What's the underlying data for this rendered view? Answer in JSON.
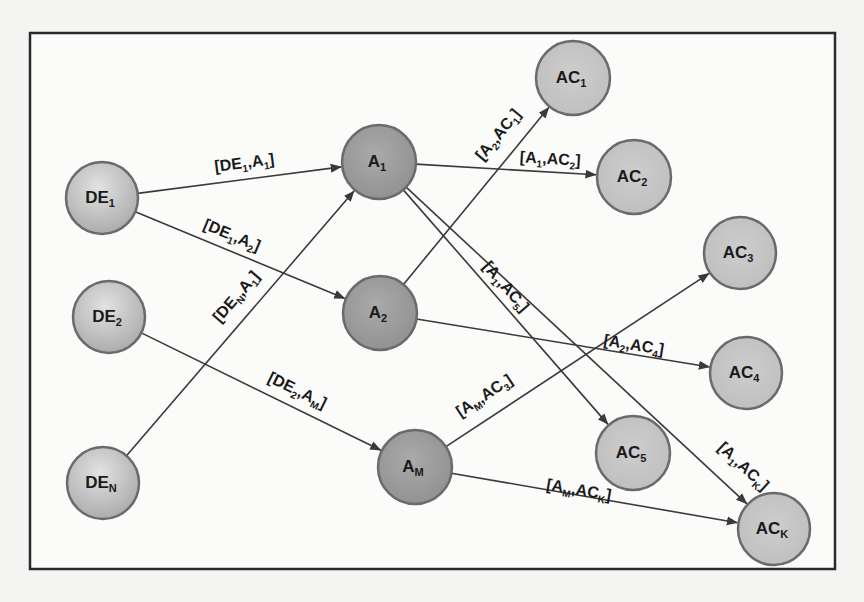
{
  "diagram": {
    "frame": {
      "x": 30,
      "y": 33,
      "w": 805,
      "h": 536,
      "stroke": "#2a2a2a"
    },
    "colors": {
      "source_fill": "#bdbdbd",
      "mid_fill": "#9a9a9a",
      "target_fill": "#c2c2c2",
      "node_stroke": "#6a6a6a",
      "edge": "#3a3a3a"
    },
    "nodes": [
      {
        "id": "DE1",
        "base": "DE",
        "sub": "1",
        "type": "source",
        "x": 102,
        "y": 198,
        "r": 36
      },
      {
        "id": "DE2",
        "base": "DE",
        "sub": "2",
        "type": "source",
        "x": 109,
        "y": 317,
        "r": 36
      },
      {
        "id": "DEN",
        "base": "DE",
        "sub": "N",
        "type": "source",
        "x": 103,
        "y": 483,
        "r": 36
      },
      {
        "id": "A1",
        "base": "A",
        "sub": "1",
        "type": "mid",
        "x": 379,
        "y": 162,
        "r": 37
      },
      {
        "id": "A2",
        "base": "A",
        "sub": "2",
        "type": "mid",
        "x": 380,
        "y": 313,
        "r": 37
      },
      {
        "id": "AM",
        "base": "A",
        "sub": "M",
        "type": "mid",
        "x": 415,
        "y": 467,
        "r": 37
      },
      {
        "id": "AC1",
        "base": "AC",
        "sub": "1",
        "type": "target",
        "x": 573,
        "y": 78,
        "r": 37
      },
      {
        "id": "AC2",
        "base": "AC",
        "sub": "2",
        "type": "target",
        "x": 634,
        "y": 177,
        "r": 37
      },
      {
        "id": "AC3",
        "base": "AC",
        "sub": "3",
        "type": "target",
        "x": 740,
        "y": 253,
        "r": 36
      },
      {
        "id": "AC4",
        "base": "AC",
        "sub": "4",
        "type": "target",
        "x": 746,
        "y": 373,
        "r": 36
      },
      {
        "id": "AC5",
        "base": "AC",
        "sub": "5",
        "type": "target",
        "x": 633,
        "y": 453,
        "r": 37
      },
      {
        "id": "ACK",
        "base": "AC",
        "sub": "K",
        "type": "target",
        "x": 774,
        "y": 529,
        "r": 36
      }
    ],
    "edges": [
      {
        "from": "DE1",
        "to": "A1",
        "label": [
          "DE",
          "1",
          "A",
          "1"
        ],
        "lx": 245,
        "ly": 168,
        "t": 0.5,
        "side": -1
      },
      {
        "from": "DE1",
        "to": "A2",
        "label": [
          "DE",
          "1",
          "A",
          "2"
        ],
        "lx": 230,
        "ly": 240,
        "t": 0.5,
        "side": -1
      },
      {
        "from": "DEN",
        "to": "A1",
        "label": [
          "DE",
          "N",
          "A",
          "1"
        ],
        "lx": 240,
        "ly": 300,
        "t": 0.5,
        "side": -1
      },
      {
        "from": "DE2",
        "to": "AM",
        "label": [
          "DE",
          "2",
          "A",
          "M"
        ],
        "lx": 295,
        "ly": 395,
        "t": 0.55,
        "side": -1
      },
      {
        "from": "A2",
        "to": "AC1",
        "label": [
          "A",
          "2",
          "AC",
          "1"
        ],
        "lx": 502,
        "ly": 138,
        "t": 0.62,
        "side": -1
      },
      {
        "from": "A1",
        "to": "AC2",
        "label": [
          "A",
          "1",
          "AC",
          "2"
        ],
        "lx": 550,
        "ly": 164,
        "t": 0.7,
        "side": -1
      },
      {
        "from": "A1",
        "to": "AC5",
        "label": [
          "A",
          "1",
          "AC",
          "5"
        ],
        "lx": 502,
        "ly": 290,
        "t": 0.45,
        "side": -1
      },
      {
        "from": "A1",
        "to": "ACK",
        "label": [
          "A",
          "1",
          "AC",
          "K"
        ],
        "lx": 740,
        "ly": 470,
        "t": 0.86,
        "side": -1
      },
      {
        "from": "A2",
        "to": "AC4",
        "label": [
          "A",
          "2",
          "AC",
          "4"
        ],
        "lx": 633,
        "ly": 350,
        "t": 0.72,
        "side": -1
      },
      {
        "from": "AM",
        "to": "AC3",
        "label": [
          "A",
          "M",
          "AC",
          "3"
        ],
        "lx": 487,
        "ly": 400,
        "t": 0.32,
        "side": -1
      },
      {
        "from": "AM",
        "to": "ACK",
        "label": [
          "A",
          "M",
          "AC",
          "K"
        ],
        "lx": 578,
        "ly": 495,
        "t": 0.5,
        "side": -1
      }
    ]
  }
}
